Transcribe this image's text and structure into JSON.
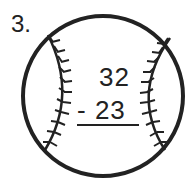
{
  "problem": {
    "number": "3.",
    "minuend": "32",
    "subtrahend_line": "- 23",
    "operation": "subtraction"
  },
  "graphic": {
    "icon": "baseball-icon",
    "stroke_color": "#222222"
  }
}
